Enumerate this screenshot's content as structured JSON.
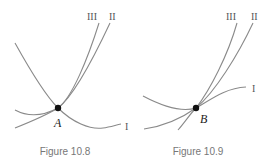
{
  "figures": [
    {
      "caption": "Figure 10.8",
      "point_label": "A",
      "curve_labels": {
        "I": "I",
        "II": "II",
        "III": "III"
      },
      "description": "Three curves meeting at point A; curve I is concave-up passing through A, curves II and III rise steeply to the upper right."
    },
    {
      "caption": "Figure 10.9",
      "point_label": "B",
      "curve_labels": {
        "I": "I",
        "II": "II",
        "III": "III"
      },
      "description": "Three curves tangent at point B; curve I flattens to the right, curves II and III rise steeply to the upper right."
    }
  ],
  "colors": {
    "curve": "#8a8a8a",
    "point": "#111111",
    "caption": "#777777"
  }
}
